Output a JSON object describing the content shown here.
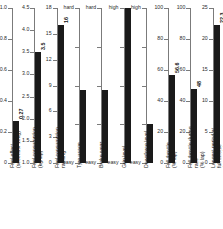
{
  "chart_data": {
    "type": "bar",
    "title": "",
    "subtitle": "",
    "xlabel": "",
    "ylabel": "",
    "grid": false,
    "legend": "none",
    "orientation": "vertical",
    "layout": "10 side-by-side single-bar panels, each with its own axis",
    "panels": [
      {
        "name": "fuel-effect",
        "label": "Fuel effect\n(seconds/ 10kg)",
        "value": 0.27,
        "value_label": "0.27",
        "ylim": [
          0,
          1.0
        ],
        "ticks": [
          0,
          0.2,
          0.4,
          0.6,
          0.8,
          1.0
        ],
        "tick_labels": [
          "0",
          "0.2",
          "0.4",
          "0.6",
          "0.8",
          "1.0"
        ],
        "scale_type": "numeric"
      },
      {
        "name": "fuel-consumption",
        "label": "Fuel consumption\n(kg/lap)",
        "value": 3.5,
        "value_label": "3.5",
        "ylim": [
          1.0,
          4.5
        ],
        "ticks": [
          1.0,
          1.5,
          2.0,
          2.5,
          3.0,
          3.5,
          4.0,
          4.5
        ],
        "tick_labels": [
          "1.0",
          "1.5",
          "2.0",
          "2.5",
          "3.0",
          "3.5",
          "4.0",
          "4.5"
        ],
        "scale_type": "numeric"
      },
      {
        "name": "fuel-consumption-ranking",
        "label": "Fuel consumption\nranking",
        "value": 16,
        "value_label": "16",
        "ylim": [
          0,
          18
        ],
        "ticks": [
          0,
          3,
          6,
          9,
          12,
          15,
          18
        ],
        "tick_labels": [
          "0",
          "3",
          "6",
          "9",
          "12",
          "15",
          "18"
        ],
        "scale_type": "numeric"
      },
      {
        "name": "tyre-usage",
        "label": "Tyre usage",
        "value": 0.47,
        "value_label": "",
        "ylim": [
          0,
          1
        ],
        "ticks": [
          0,
          0.25,
          0.5,
          0.75,
          1
        ],
        "tick_labels": [
          "easy",
          "",
          "",
          "",
          "hard"
        ],
        "scale_type": "qualitative"
      },
      {
        "name": "brake-wear",
        "label": "Brake wear",
        "value": 0.47,
        "value_label": "",
        "ylim": [
          0,
          1
        ],
        "ticks": [
          0,
          0.25,
          0.5,
          0.75,
          1
        ],
        "tick_labels": [
          "easy",
          "",
          "",
          "",
          "hard"
        ],
        "scale_type": "qualitative"
      },
      {
        "name": "grip-level",
        "label": "Grip level",
        "value": 1.0,
        "value_label": "",
        "ylim": [
          0,
          1
        ],
        "ticks": [
          0,
          0.25,
          0.5,
          0.75,
          1
        ],
        "tick_labels": [
          "easy",
          "",
          "",
          "",
          "high"
        ],
        "scale_type": "qualitative"
      },
      {
        "name": "downforce-level",
        "label": "Downforce level",
        "value": 0.25,
        "value_label": "",
        "ylim": [
          0,
          1
        ],
        "ticks": [
          0,
          0.25,
          0.5,
          0.75,
          1
        ],
        "tick_labels": [
          "easy",
          "",
          "",
          "",
          "high"
        ],
        "scale_type": "qualitative"
      },
      {
        "name": "full-throttle",
        "label": "Full throttle\n(% lap)",
        "value": 56.6,
        "value_label": "56.6",
        "ylim": [
          0,
          100
        ],
        "ticks": [
          0,
          20,
          40,
          60,
          80,
          100
        ],
        "tick_labels": [
          "0",
          "20",
          "40",
          "60",
          "80",
          "100"
        ],
        "scale_type": "numeric"
      },
      {
        "name": "full-throttle-during-race",
        "label": "Full throttle during\nrace\n(% lap)",
        "value": 48,
        "value_label": "48",
        "ylim": [
          0,
          100
        ],
        "ticks": [
          0,
          20,
          40,
          60,
          80,
          100
        ],
        "tick_labels": [
          "0",
          "20",
          "40",
          "60",
          "80",
          "100"
        ],
        "scale_type": "numeric"
      },
      {
        "name": "longest-period-at-full-throttle",
        "label": "Longest period at\nfull throttle\n(seconds)",
        "value": 22.3,
        "value_label": "22.3",
        "ylim": [
          0,
          25
        ],
        "ticks": [
          0,
          5,
          10,
          15,
          20,
          25
        ],
        "tick_labels": [
          "0",
          "5",
          "10",
          "15",
          "20",
          "25"
        ],
        "scale_type": "numeric"
      }
    ],
    "colors": {
      "bar": "#1a1a1a",
      "axis": "#7b7b7b",
      "text": "#1c1c1c",
      "background": "#ffffff"
    }
  }
}
